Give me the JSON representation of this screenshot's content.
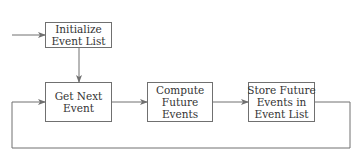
{
  "diagram": {
    "type": "flowchart",
    "nodes": [
      {
        "id": "init",
        "lines": [
          "Initialize",
          "Event List"
        ]
      },
      {
        "id": "next",
        "lines": [
          "Get Next",
          "Event"
        ]
      },
      {
        "id": "compute",
        "lines": [
          "Compute",
          "Future",
          "Events"
        ]
      },
      {
        "id": "store",
        "lines": [
          "Store Future",
          "Events in",
          "Event List"
        ]
      }
    ],
    "edges": [
      {
        "from": "start",
        "to": "init"
      },
      {
        "from": "init",
        "to": "next"
      },
      {
        "from": "next",
        "to": "compute"
      },
      {
        "from": "compute",
        "to": "store"
      },
      {
        "from": "store",
        "to": "next",
        "kind": "loop-back"
      }
    ],
    "colors": {
      "line": "#707070",
      "text": "#333333",
      "background": "#ffffff"
    }
  }
}
